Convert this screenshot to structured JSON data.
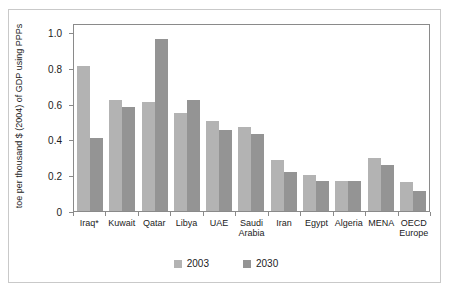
{
  "figure": {
    "title": "",
    "note": "Iraq*"
  },
  "chart_data": {
    "type": "bar",
    "title": "",
    "xlabel": "",
    "ylabel": "toe per thousand $ (2004) of GDP using PPPs",
    "ylim": [
      0,
      1.05
    ],
    "yticks": [
      "0",
      "0.2",
      "0.4",
      "0.6",
      "0.8",
      "1.0"
    ],
    "ytickvalues": [
      0,
      0.2,
      0.4,
      0.6,
      0.8,
      1.0
    ],
    "grid": false,
    "legend_position": "bottom",
    "categories": [
      "Iraq*",
      "Kuwait",
      "Qatar",
      "Libya",
      "UAE",
      "Saudi\nArabia",
      "Iran",
      "Egypt",
      "Algeria",
      "MENA",
      "OECD\nEurope"
    ],
    "series": [
      {
        "name": "2003",
        "color": "#b3b3b3",
        "values": [
          0.81,
          0.62,
          0.61,
          0.55,
          0.5,
          0.47,
          0.285,
          0.2,
          0.165,
          0.295,
          0.16
        ]
      },
      {
        "name": "2030",
        "color": "#949494",
        "values": [
          0.41,
          0.58,
          0.96,
          0.62,
          0.455,
          0.43,
          0.22,
          0.165,
          0.17,
          0.255,
          0.11
        ]
      }
    ]
  },
  "legend": [
    {
      "label": "2003",
      "color": "#b3b3b3"
    },
    {
      "label": "2030",
      "color": "#949494"
    }
  ]
}
